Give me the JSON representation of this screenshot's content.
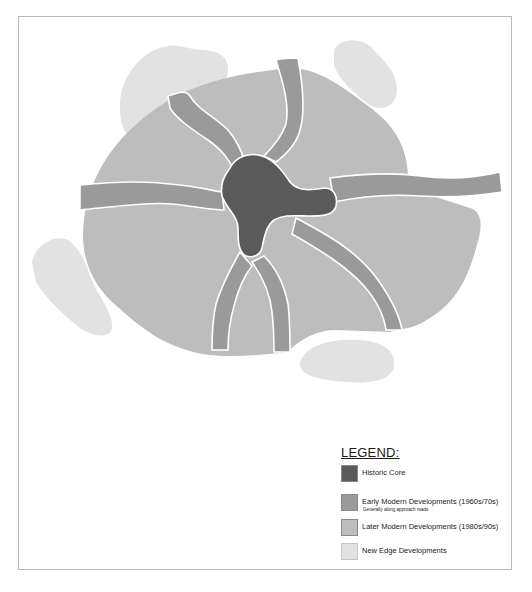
{
  "colors": {
    "historic_core": "#5a5a5a",
    "early_modern": "#9a9a9a",
    "later_modern": "#bdbdbd",
    "new_edge": "#e2e2e2",
    "frame_border": "#b9b9b9",
    "background": "#ffffff"
  },
  "legend": {
    "title": "LEGEND:",
    "items": [
      {
        "label": "Historic Core",
        "sublabel": "",
        "color_key": "historic_core"
      },
      {
        "label": "Early Modern Developments (1960s/70s)",
        "sublabel": "Generally along approach roads",
        "color_key": "early_modern"
      },
      {
        "label": "Later Modern Developments (1980s/90s)",
        "sublabel": "",
        "color_key": "later_modern"
      },
      {
        "label": "New Edge Developments",
        "sublabel": "",
        "color_key": "new_edge"
      }
    ]
  },
  "map": {
    "regions": [
      {
        "name": "new-edge-northwest",
        "category": "new_edge"
      },
      {
        "name": "new-edge-northeast",
        "category": "new_edge"
      },
      {
        "name": "new-edge-west",
        "category": "new_edge"
      },
      {
        "name": "new-edge-south",
        "category": "new_edge"
      },
      {
        "name": "later-modern-ring",
        "category": "later_modern"
      },
      {
        "name": "early-modern-approach-roads",
        "category": "early_modern"
      },
      {
        "name": "historic-core",
        "category": "historic_core"
      }
    ]
  }
}
